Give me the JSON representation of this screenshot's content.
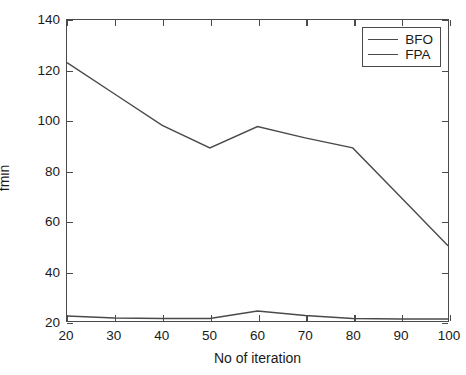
{
  "chart_data": {
    "type": "line",
    "title": "",
    "xlabel": "No of iteration",
    "ylabel": "fmin",
    "xlim": [
      20,
      100
    ],
    "ylim": [
      20,
      140
    ],
    "xticks": [
      20,
      30,
      40,
      50,
      60,
      70,
      80,
      90,
      100
    ],
    "yticks": [
      20,
      40,
      60,
      80,
      100,
      120,
      140
    ],
    "xtick_labels": [
      "20",
      "30",
      "40",
      "50",
      "60",
      "70",
      "80",
      "90",
      "100"
    ],
    "ytick_labels": [
      "20",
      "40",
      "60",
      "80",
      "100",
      "120",
      "140"
    ],
    "grid": false,
    "legend_position": "upper right",
    "x": [
      20,
      30,
      40,
      50,
      60,
      70,
      80,
      90,
      100
    ],
    "series": [
      {
        "name": "BFO",
        "color": "#4a4a4a",
        "values": [
          22,
          21.2,
          21,
          21,
          24,
          22.2,
          21,
          20.8,
          20.8
        ]
      },
      {
        "name": "FPA",
        "color": "#4a4a4a",
        "values": [
          123,
          110.5,
          98,
          89,
          97.5,
          93,
          89,
          69.5,
          50
        ]
      }
    ]
  },
  "legend": {
    "entries": [
      {
        "label": "BFO"
      },
      {
        "label": "FPA"
      }
    ]
  },
  "axes": {
    "x_title": "No of iteration",
    "y_title": "fmin"
  },
  "colors": {
    "line": "#4a4a4a",
    "axis": "#4a4a4a",
    "text": "#1a1a1a",
    "background": "#ffffff"
  }
}
